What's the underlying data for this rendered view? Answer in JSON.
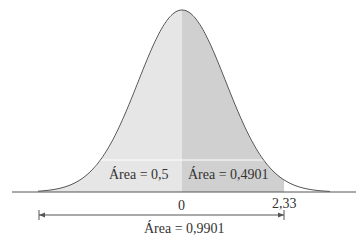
{
  "chart_data": {
    "type": "area",
    "title": "",
    "xlabel": "",
    "ylabel": "",
    "x_ticks": [
      "0",
      "2,33"
    ],
    "mean": 0,
    "z_value": 2.33,
    "regions": [
      {
        "name": "left-half",
        "from": "-inf",
        "to": 0,
        "area": 0.5,
        "label": "Área = 0,5",
        "color": "#e6e6e6"
      },
      {
        "name": "zero-to-z",
        "from": 0,
        "to": 2.33,
        "area": 0.4901,
        "label": "Área = 0,4901",
        "color": "#d0d0d0"
      }
    ],
    "total": {
      "from": "-inf",
      "to": 2.33,
      "area": 0.9901,
      "label": "Área = 0,9901"
    },
    "grid": false,
    "legend": "none"
  },
  "labels": {
    "left_area": "Área = 0,5",
    "right_area": "Área = 0,4901",
    "total_area": "Área = 0,9901",
    "tick_zero": "0",
    "tick_z": "2,33"
  }
}
